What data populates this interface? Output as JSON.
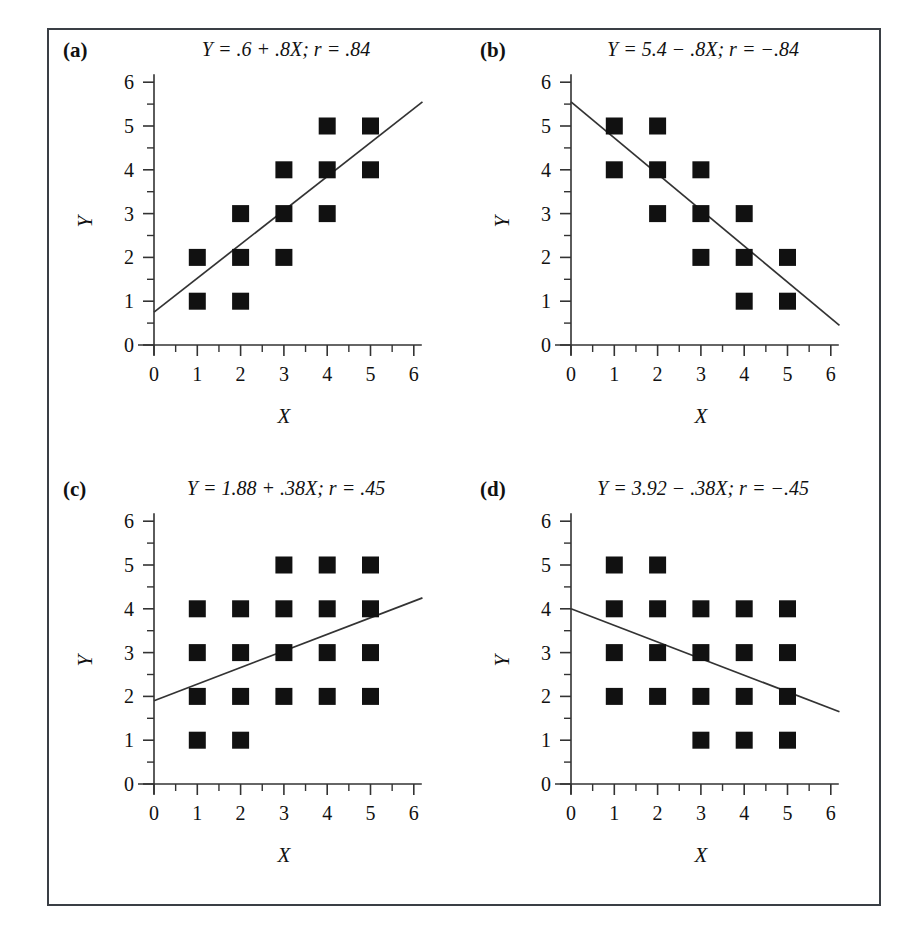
{
  "figure": {
    "border_color": "#3a3f45",
    "marker_color": "#111111",
    "axis_color": "#333333",
    "line_color": "#333333",
    "background": "#ffffff"
  },
  "panels": [
    {
      "letter": "(a)",
      "title": "Y = .6 + .8X; r = .84",
      "xlabel": "X",
      "ylabel": "Y"
    },
    {
      "letter": "(b)",
      "title": "Y = 5.4 − .8X; r = −.84",
      "xlabel": "X",
      "ylabel": "Y"
    },
    {
      "letter": "(c)",
      "title": "Y = 1.88 + .38X; r = .45",
      "xlabel": "X",
      "ylabel": "Y"
    },
    {
      "letter": "(d)",
      "title": "Y = 3.92 − .38X; r = −.45",
      "xlabel": "X",
      "ylabel": "Y"
    }
  ],
  "chart_data": [
    {
      "type": "scatter",
      "panel": "a",
      "title": "Y = .6 + .8X; r = .84",
      "xlabel": "X",
      "ylabel": "Y",
      "xlim": [
        0,
        6
      ],
      "ylim": [
        0,
        6
      ],
      "xticks": [
        0,
        1,
        2,
        3,
        4,
        5,
        6
      ],
      "yticks": [
        0,
        1,
        2,
        3,
        4,
        5,
        6
      ],
      "minor_ticks": true,
      "grid": false,
      "legend": null,
      "points": [
        [
          1,
          1
        ],
        [
          1,
          2
        ],
        [
          2,
          1
        ],
        [
          2,
          2
        ],
        [
          2,
          3
        ],
        [
          3,
          2
        ],
        [
          3,
          3
        ],
        [
          3,
          4
        ],
        [
          4,
          3
        ],
        [
          4,
          4
        ],
        [
          4,
          5
        ],
        [
          5,
          4
        ],
        [
          5,
          5
        ]
      ],
      "fit_line": {
        "intercept": 0.6,
        "slope": 0.8,
        "r": 0.84,
        "x_from": 0.0,
        "x_to": 6.2,
        "y_from": 0.75,
        "y_to": 5.55
      }
    },
    {
      "type": "scatter",
      "panel": "b",
      "title": "Y = 5.4 − .8X; r = −.84",
      "xlabel": "X",
      "ylabel": "Y",
      "xlim": [
        0,
        6
      ],
      "ylim": [
        0,
        6
      ],
      "xticks": [
        0,
        1,
        2,
        3,
        4,
        5,
        6
      ],
      "yticks": [
        0,
        1,
        2,
        3,
        4,
        5,
        6
      ],
      "minor_ticks": true,
      "grid": false,
      "legend": null,
      "points": [
        [
          1,
          4
        ],
        [
          1,
          5
        ],
        [
          2,
          3
        ],
        [
          2,
          4
        ],
        [
          2,
          5
        ],
        [
          3,
          2
        ],
        [
          3,
          3
        ],
        [
          3,
          4
        ],
        [
          4,
          1
        ],
        [
          4,
          2
        ],
        [
          4,
          3
        ],
        [
          5,
          1
        ],
        [
          5,
          2
        ]
      ],
      "fit_line": {
        "intercept": 5.4,
        "slope": -0.8,
        "r": -0.84,
        "x_from": 0.0,
        "x_to": 6.2,
        "y_from": 5.55,
        "y_to": 0.45
      }
    },
    {
      "type": "scatter",
      "panel": "c",
      "title": "Y = 1.88 + .38X; r = .45",
      "xlabel": "X",
      "ylabel": "Y",
      "xlim": [
        0,
        6
      ],
      "ylim": [
        0,
        6
      ],
      "xticks": [
        0,
        1,
        2,
        3,
        4,
        5,
        6
      ],
      "yticks": [
        0,
        1,
        2,
        3,
        4,
        5,
        6
      ],
      "minor_ticks": true,
      "grid": false,
      "legend": null,
      "points": [
        [
          1,
          1
        ],
        [
          1,
          2
        ],
        [
          1,
          3
        ],
        [
          1,
          4
        ],
        [
          2,
          1
        ],
        [
          2,
          2
        ],
        [
          2,
          3
        ],
        [
          2,
          4
        ],
        [
          3,
          2
        ],
        [
          3,
          3
        ],
        [
          3,
          4
        ],
        [
          3,
          5
        ],
        [
          4,
          2
        ],
        [
          4,
          3
        ],
        [
          4,
          4
        ],
        [
          4,
          5
        ],
        [
          5,
          2
        ],
        [
          5,
          3
        ],
        [
          5,
          4
        ],
        [
          5,
          5
        ]
      ],
      "fit_line": {
        "intercept": 1.88,
        "slope": 0.38,
        "r": 0.45,
        "x_from": 0.0,
        "x_to": 6.2,
        "y_from": 1.9,
        "y_to": 4.25
      }
    },
    {
      "type": "scatter",
      "panel": "d",
      "title": "Y = 3.92 − .38X; r = −.45",
      "xlabel": "X",
      "ylabel": "Y",
      "xlim": [
        0,
        6
      ],
      "ylim": [
        0,
        6
      ],
      "xticks": [
        0,
        1,
        2,
        3,
        4,
        5,
        6
      ],
      "yticks": [
        0,
        1,
        2,
        3,
        4,
        5,
        6
      ],
      "minor_ticks": true,
      "grid": false,
      "legend": null,
      "points": [
        [
          1,
          2
        ],
        [
          1,
          3
        ],
        [
          1,
          4
        ],
        [
          1,
          5
        ],
        [
          2,
          2
        ],
        [
          2,
          3
        ],
        [
          2,
          4
        ],
        [
          2,
          5
        ],
        [
          3,
          1
        ],
        [
          3,
          2
        ],
        [
          3,
          3
        ],
        [
          3,
          4
        ],
        [
          4,
          1
        ],
        [
          4,
          2
        ],
        [
          4,
          3
        ],
        [
          4,
          4
        ],
        [
          5,
          1
        ],
        [
          5,
          2
        ],
        [
          5,
          3
        ],
        [
          5,
          4
        ]
      ],
      "fit_line": {
        "intercept": 3.92,
        "slope": -0.38,
        "r": -0.45,
        "x_from": 0.0,
        "x_to": 6.2,
        "y_from": 4.0,
        "y_to": 1.65
      }
    }
  ]
}
